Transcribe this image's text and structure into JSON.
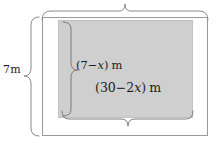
{
  "figure": {
    "type": "geometry-diagram",
    "canvas": {
      "width": 217,
      "height": 143,
      "background": "#ffffff"
    },
    "shapes": {
      "outer_rectangle": {
        "name": "outer-rectangle",
        "x": 42,
        "y": 17,
        "width": 166,
        "height": 119,
        "fill": "#ffffff",
        "stroke": "#9a9a9a"
      },
      "shaded_rectangle": {
        "name": "shaded-inner-rectangle",
        "x": 58,
        "y": 20,
        "width": 135,
        "height": 98,
        "fill": "#cfcfcf",
        "stroke": "#c2c2c2"
      }
    },
    "braces": [
      {
        "name": "top-brace",
        "orientation": "horizontal",
        "spans": "outer-rectangle-width",
        "label": "",
        "x1": 42,
        "x2": 208,
        "y": 17
      },
      {
        "name": "left-brace",
        "orientation": "vertical",
        "spans": "outer-rectangle-height",
        "label": "7m",
        "x": 42,
        "y1": 17,
        "y2": 136
      },
      {
        "name": "inner-left-brace",
        "orientation": "vertical",
        "spans": "shaded-rectangle-height",
        "label": "(7-x) m",
        "x": 62,
        "y1": 22,
        "y2": 116
      },
      {
        "name": "inner-bottom-brace",
        "orientation": "horizontal",
        "spans": "shaded-rectangle-width",
        "label": "(30-2x) m",
        "x1": 62,
        "x2": 193,
        "y": 116
      }
    ],
    "labels": {
      "outer_height": {
        "text": "7m",
        "value": "7",
        "unit": "m"
      },
      "inner_height": {
        "open_paren": "(",
        "expression_prefix": "7",
        "minus": "−",
        "variable": "x",
        "close_paren": ")",
        "unit": "m",
        "full_text": "(7−x) m"
      },
      "inner_width": {
        "open_paren": "(",
        "expression_prefix": "30",
        "minus": "−",
        "coefficient": "2",
        "variable": "x",
        "close_paren": ")",
        "unit": "m",
        "full_text": "(30−2x) m"
      }
    },
    "colors": {
      "shade": "#cfcfcf",
      "outline": "#9a9a9a",
      "brace": "#8a8a8a",
      "text": "#1c1c1c",
      "background": "#ffffff"
    }
  }
}
